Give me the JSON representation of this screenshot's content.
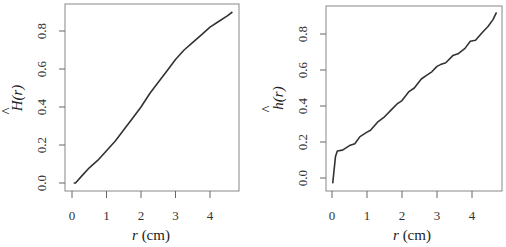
{
  "chart_data": [
    {
      "type": "line",
      "title": "",
      "xlabel": "r (cm)",
      "ylabel": "Ĥ(r)",
      "xlim": [
        -0.2,
        4.85
      ],
      "ylim": [
        -0.04,
        0.94
      ],
      "xticks": [
        "0",
        "1",
        "2",
        "3",
        "4"
      ],
      "yticks": [
        "0.0",
        "0.2",
        "0.4",
        "0.6",
        "0.8"
      ],
      "grid": false,
      "legend": null,
      "series": [
        {
          "name": "H_hat",
          "x": [
            0.05,
            0.1,
            0.3,
            0.5,
            0.75,
            1.0,
            1.25,
            1.5,
            1.75,
            2.0,
            2.25,
            2.5,
            2.75,
            3.0,
            3.25,
            3.5,
            3.75,
            4.0,
            4.25,
            4.5,
            4.65
          ],
          "y": [
            0.0,
            0.0,
            0.04,
            0.08,
            0.12,
            0.17,
            0.22,
            0.28,
            0.34,
            0.4,
            0.47,
            0.53,
            0.59,
            0.65,
            0.7,
            0.74,
            0.78,
            0.82,
            0.85,
            0.88,
            0.9
          ]
        }
      ]
    },
    {
      "type": "line",
      "title": "",
      "xlabel": "r (cm)",
      "ylabel": "ĥ(r)",
      "xlim": [
        -0.2,
        4.85
      ],
      "ylim": [
        -0.07,
        0.94
      ],
      "xticks": [
        "0",
        "1",
        "2",
        "3",
        "4"
      ],
      "yticks": [
        "0.0",
        "0.2",
        "0.4",
        "0.6",
        "0.8"
      ],
      "grid": false,
      "legend": null,
      "series": [
        {
          "name": "h_hat",
          "x": [
            0.02,
            0.1,
            0.15,
            0.3,
            0.5,
            0.65,
            0.8,
            1.0,
            1.1,
            1.3,
            1.5,
            1.7,
            1.85,
            2.0,
            2.2,
            2.35,
            2.55,
            2.7,
            2.85,
            3.0,
            3.1,
            3.25,
            3.45,
            3.6,
            3.8,
            3.95,
            4.1,
            4.3,
            4.45,
            4.6,
            4.7
          ],
          "y": [
            -0.03,
            0.12,
            0.15,
            0.155,
            0.18,
            0.19,
            0.23,
            0.255,
            0.265,
            0.31,
            0.34,
            0.38,
            0.41,
            0.43,
            0.48,
            0.5,
            0.55,
            0.57,
            0.59,
            0.62,
            0.63,
            0.64,
            0.68,
            0.69,
            0.72,
            0.76,
            0.765,
            0.81,
            0.84,
            0.88,
            0.92
          ]
        }
      ]
    }
  ],
  "plots": [
    {
      "ylabel_main": "H",
      "ylabel_hat": "^",
      "ylabel_arg": "(r)",
      "xlabel_var": "r",
      "xlabel_unit": " (cm)",
      "xtick_labels": [
        "0",
        "1",
        "2",
        "3",
        "4"
      ],
      "ytick_labels": [
        "0.0",
        "0.2",
        "0.4",
        "0.6",
        "0.8"
      ]
    },
    {
      "ylabel_main": "h",
      "ylabel_hat": "^",
      "ylabel_arg": "(r)",
      "xlabel_var": "r",
      "xlabel_unit": " (cm)",
      "xtick_labels": [
        "0",
        "1",
        "2",
        "3",
        "4"
      ],
      "ytick_labels": [
        "0.0",
        "0.2",
        "0.4",
        "0.6",
        "0.8"
      ]
    }
  ]
}
